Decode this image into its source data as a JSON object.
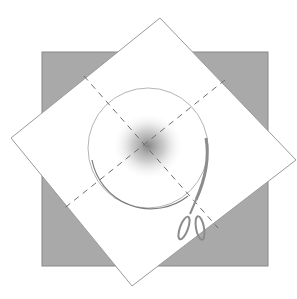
{
  "illustration": {
    "subject": "folded paper square with dashed fold lines, circle guide and scissors",
    "colors": {
      "background": "#ffffff",
      "square_fill": "#a9a9a9",
      "paper_fill": "#ffffff",
      "outline": "#8a8a8a",
      "dash": "#6f6f6f",
      "center_smudge": "#7a7a7a",
      "scissors": "#8c8c8c"
    },
    "square": {
      "x": 42,
      "y": 52,
      "w": 226,
      "h": 214
    },
    "diamond": {
      "points": "160,18 296,160 132,286 11,138"
    },
    "circle": {
      "cx": 148,
      "cy": 148,
      "r": 60
    },
    "fold_lines": [
      {
        "x1": 84,
        "y1": 76,
        "x2": 218,
        "y2": 228
      },
      {
        "x1": 225,
        "y1": 80,
        "x2": 62,
        "y2": 210
      }
    ]
  }
}
